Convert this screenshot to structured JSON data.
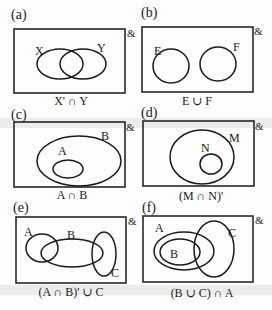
{
  "universal_symbol": "&",
  "panels": [
    {
      "id": "a",
      "label": "(a)",
      "caption": "X' ∩ Y",
      "sets": [
        "X",
        "Y"
      ]
    },
    {
      "id": "b",
      "label": "(b)",
      "caption": "E ∪ F",
      "sets": [
        "E",
        "F"
      ]
    },
    {
      "id": "c",
      "label": "(c)",
      "caption": "A ∩ B",
      "sets": [
        "A",
        "B"
      ]
    },
    {
      "id": "d",
      "label": "(d)",
      "caption": "(M ∩ N)'",
      "sets": [
        "M",
        "N"
      ]
    },
    {
      "id": "e",
      "label": "(e)",
      "caption": "(A ∩ B)' ∪ C",
      "sets": [
        "A",
        "B",
        "C"
      ]
    },
    {
      "id": "f",
      "label": "(f)",
      "caption": "(B ∪ C) ∩ A",
      "sets": [
        "A",
        "B",
        "C"
      ]
    }
  ]
}
